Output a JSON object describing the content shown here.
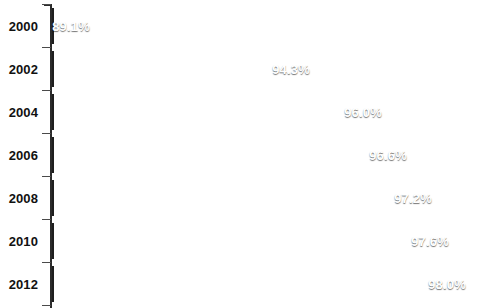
{
  "chart_data": {
    "type": "bar",
    "orientation": "horizontal",
    "title": "",
    "xlabel": "",
    "ylabel": "",
    "categories": [
      "2000",
      "2002",
      "2004",
      "2006",
      "2008",
      "2010",
      "2012"
    ],
    "values": [
      89.1,
      94.3,
      96.0,
      96.6,
      97.2,
      97.6,
      98.0
    ],
    "value_labels": [
      "89.1%",
      "94.3%",
      "96.0%",
      "96.6%",
      "97.2%",
      "97.6%",
      "98.0%"
    ],
    "xlim": [
      88.0,
      98.3
    ],
    "grid": false,
    "legend": null,
    "series": [
      {
        "name": "Percent",
        "values": [
          89.1,
          94.3,
          96.0,
          96.6,
          97.2,
          97.6,
          98.0
        ]
      }
    ]
  },
  "style": {
    "bar_fill_top": "#c2c2c2",
    "bar_fill_bottom": "#7c7c7c",
    "bar_border": "#1e1e1e",
    "axis_color": "#2b2b2b",
    "value_label_color": "#ffffff",
    "category_label_color": "#111111",
    "background": "#ffffff"
  }
}
